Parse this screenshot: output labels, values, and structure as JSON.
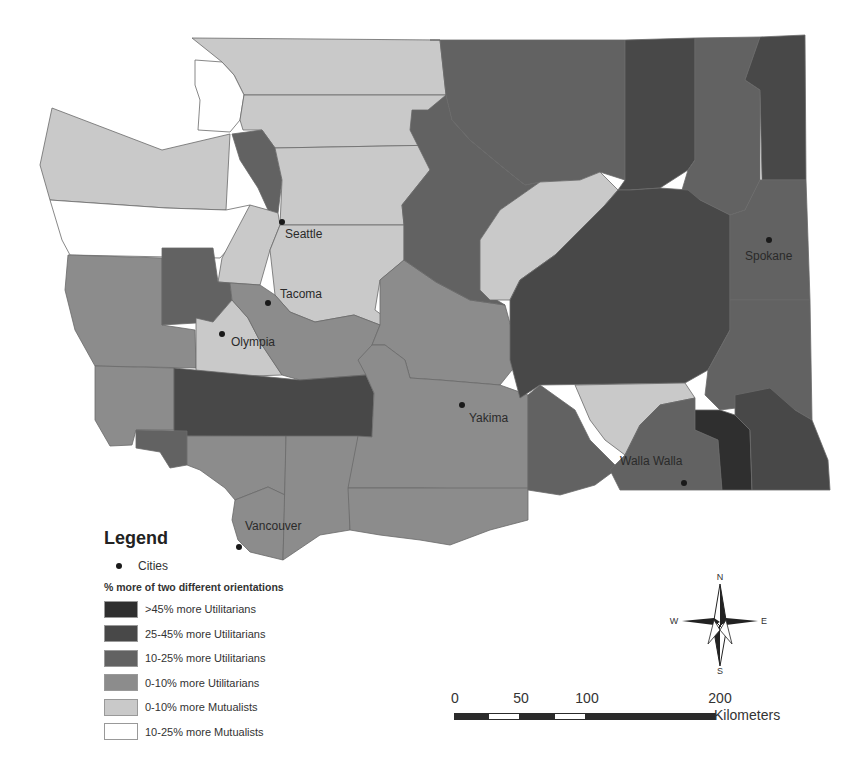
{
  "map": {
    "title": "Washington State orientation map",
    "classes": [
      {
        "id": "u45",
        "label": ">45% more Utilitarians",
        "color": "#2f2f2f"
      },
      {
        "id": "u25",
        "label": "25-45% more Utilitarians",
        "color": "#484848"
      },
      {
        "id": "u10",
        "label": "10-25% more Utilitarians",
        "color": "#626262"
      },
      {
        "id": "u0",
        "label": "0-10% more Utilitarians",
        "color": "#8c8c8c"
      },
      {
        "id": "m0",
        "label": "0-10% more Mutualists",
        "color": "#c9c9c9"
      },
      {
        "id": "m10",
        "label": "10-25% more Mutualists",
        "color": "#ffffff"
      }
    ],
    "cities": [
      {
        "name": "Seattle"
      },
      {
        "name": "Tacoma"
      },
      {
        "name": "Olympia"
      },
      {
        "name": "Spokane"
      },
      {
        "name": "Yakima"
      },
      {
        "name": "Walla Walla"
      },
      {
        "name": "Vancouver"
      }
    ]
  },
  "legend": {
    "title": "Legend",
    "cities_label": "Cities",
    "subtitle": "% more of two different orientations",
    "items": [
      {
        "label": ">45% more Utilitarians",
        "color": "#2f2f2f"
      },
      {
        "label": "25-45% more Utilitarians",
        "color": "#484848"
      },
      {
        "label": "10-25% more Utilitarians",
        "color": "#626262"
      },
      {
        "label": "0-10% more Utilitarians",
        "color": "#8c8c8c"
      },
      {
        "label": "0-10% more Mutualists",
        "color": "#c9c9c9"
      },
      {
        "label": "10-25% more Mutualists",
        "color": "#ffffff"
      }
    ]
  },
  "compass": {
    "n": "N",
    "s": "S",
    "e": "E",
    "w": "W"
  },
  "scale": {
    "ticks": [
      "0",
      "50",
      "100",
      "200"
    ],
    "units": "Kilometers"
  }
}
